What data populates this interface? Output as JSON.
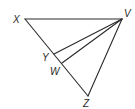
{
  "figure": {
    "type": "geometry-diagram",
    "points": [
      {
        "id": "X",
        "label": "X"
      },
      {
        "id": "V",
        "label": "V"
      },
      {
        "id": "Y",
        "label": "Y"
      },
      {
        "id": "W",
        "label": "W"
      },
      {
        "id": "Z",
        "label": "Z"
      }
    ],
    "segments": [
      {
        "from": "X",
        "to": "V"
      },
      {
        "from": "X",
        "to": "Z"
      },
      {
        "from": "V",
        "to": "Z"
      },
      {
        "from": "V",
        "to": "Y"
      },
      {
        "from": "V",
        "to": "W"
      }
    ]
  },
  "colors": {
    "stroke": "#2a2a2a",
    "background": "#ffffff"
  }
}
